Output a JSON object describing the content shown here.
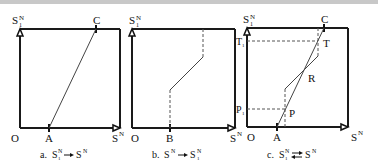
{
  "panels": [
    {
      "id": "a",
      "caption": "a. S₁ᴺ → Sᴺ",
      "caption_prefix": "a.",
      "y_axis": "S1N",
      "x_axis": "SN",
      "origin": "O",
      "points": {
        "A": "A",
        "C": "C"
      }
    },
    {
      "id": "b",
      "caption": "b. Sᴺ → S₁ᴺ",
      "caption_prefix": "b.",
      "y_axis": "S1N",
      "x_axis": "SN",
      "origin": "O",
      "points": {
        "B": "B"
      }
    },
    {
      "id": "c",
      "caption": "c. S₁ᴺ ⇄ Sᴺ",
      "caption_prefix": "c.",
      "y_axis": "S1N",
      "x_axis": "SN",
      "origin": "O",
      "points": {
        "A": "A",
        "C": "C",
        "T": "T",
        "R": "R",
        "P": "P",
        "T1": "T",
        "P1": "P"
      }
    }
  ],
  "labels": {
    "S": "S",
    "N": "N",
    "sub1": "1",
    "O": "O",
    "A": "A",
    "B": "B",
    "C": "C",
    "T": "T",
    "R": "R",
    "P": "P",
    "a": "a.",
    "b": "b.",
    "c": "c."
  },
  "colors": {
    "line": "#1a1a1a",
    "thin": "#444444",
    "dashed": "#555555",
    "topbar": "#c8c8c8"
  }
}
